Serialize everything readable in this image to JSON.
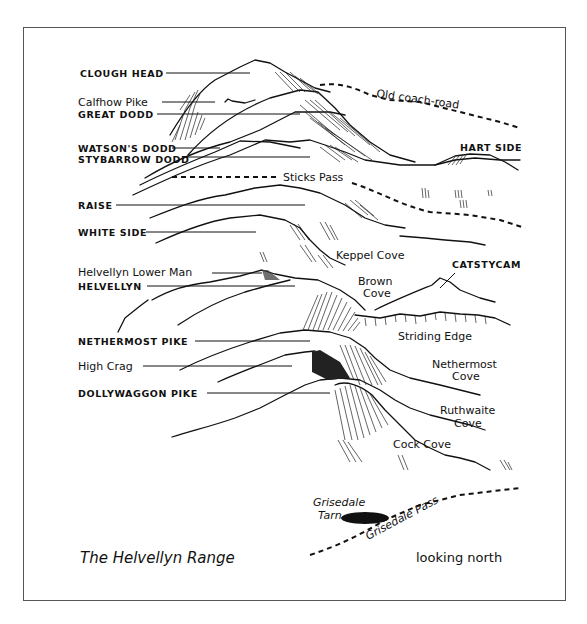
{
  "diagram": {
    "title": "The Helvellyn Range",
    "orientation_note": "looking north",
    "summits": [
      {
        "id": "clough-head",
        "label": "CLOUGH HEAD",
        "style": "caps"
      },
      {
        "id": "calfhow-pike",
        "label": "Calfhow Pike",
        "style": "mixed"
      },
      {
        "id": "great-dodd",
        "label": "GREAT DODD",
        "style": "caps"
      },
      {
        "id": "watsons-dodd",
        "label": "WATSON'S DODD",
        "style": "caps"
      },
      {
        "id": "stybarrow-dodd",
        "label": "STYBARROW DODD",
        "style": "caps"
      },
      {
        "id": "raise",
        "label": "RAISE",
        "style": "caps"
      },
      {
        "id": "white-side",
        "label": "WHITE SIDE",
        "style": "caps"
      },
      {
        "id": "helvellyn-lower-man",
        "label": "Helvellyn Lower Man",
        "style": "mixed"
      },
      {
        "id": "helvellyn",
        "label": "HELVELLYN",
        "style": "caps"
      },
      {
        "id": "nethermost-pike",
        "label": "NETHERMOST PIKE",
        "style": "caps"
      },
      {
        "id": "high-crag",
        "label": "High Crag",
        "style": "mixed"
      },
      {
        "id": "dollywaggon-pike",
        "label": "DOLLYWAGGON PIKE",
        "style": "caps"
      }
    ],
    "side_features": {
      "hart_side": "HART SIDE",
      "catstycam": "CATSTYCAM",
      "keppel_cove": "Keppel Cove",
      "brown_cove_line1": "Brown",
      "brown_cove_line2": "Cove",
      "striding_edge": "Striding Edge",
      "nethermost_cove_line1": "Nethermost",
      "nethermost_cove_line2": "Cove",
      "ruthwaite_cove_line1": "Ruthwaite",
      "ruthwaite_cove_line2": "Cove",
      "cock_cove": "Cock Cove",
      "grisedale_tarn_line1": "Grisedale",
      "grisedale_tarn_line2": "Tarn"
    },
    "routes": {
      "old_coach_road": "Old coach-road",
      "sticks_pass": "Sticks Pass",
      "grisedale_pass": "Grisedale Pass"
    },
    "colors": {
      "ink": "#111111",
      "paper": "#ffffff",
      "frame": "#555555"
    }
  }
}
